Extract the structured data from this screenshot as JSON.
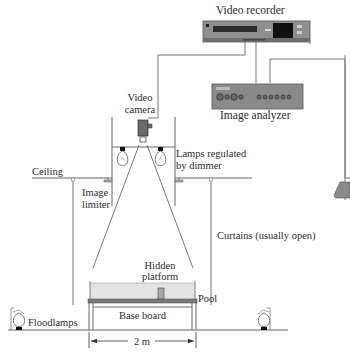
{
  "diagram": {
    "labels": {
      "video_recorder": "Video recorder",
      "image_analyzer": "Image analyzer",
      "video_camera_line1": "Video",
      "video_camera_line2": "camera",
      "lamps_line1": "Lamps regulated",
      "lamps_line2": "by dimmer",
      "ceiling": "Ceiling",
      "image_limiter_line1": "Image",
      "image_limiter_line2": "limiter",
      "curtains": "Curtains (usually open)",
      "hidden_platform_line1": "Hidden",
      "hidden_platform_line2": "platform",
      "pool": "Pool",
      "base_board": "Base board",
      "floodlamps": "Floodlamps",
      "dimension": "2 m"
    },
    "components": [
      {
        "id": "video-recorder",
        "icon": "vcr-icon"
      },
      {
        "id": "image-analyzer",
        "icon": "analyzer-panel-icon"
      },
      {
        "id": "monitor",
        "icon": "monitor-icon"
      },
      {
        "id": "video-camera",
        "icon": "camera-icon"
      },
      {
        "id": "dimmer-lamps",
        "icon": "light-bulb-icon",
        "count": 2
      },
      {
        "id": "floodlamps",
        "icon": "floodlamp-icon",
        "count": 2
      },
      {
        "id": "pool",
        "icon": "pool-icon"
      },
      {
        "id": "hidden-platform",
        "icon": "platform-icon"
      }
    ],
    "colors": {
      "line": "#555555",
      "device_fill": "#8a8a8a",
      "device_dark": "#1a1a1a",
      "water": "#e6e6e6",
      "pool_floor": "#7a7a7a",
      "text": "#2a2a2a"
    }
  }
}
